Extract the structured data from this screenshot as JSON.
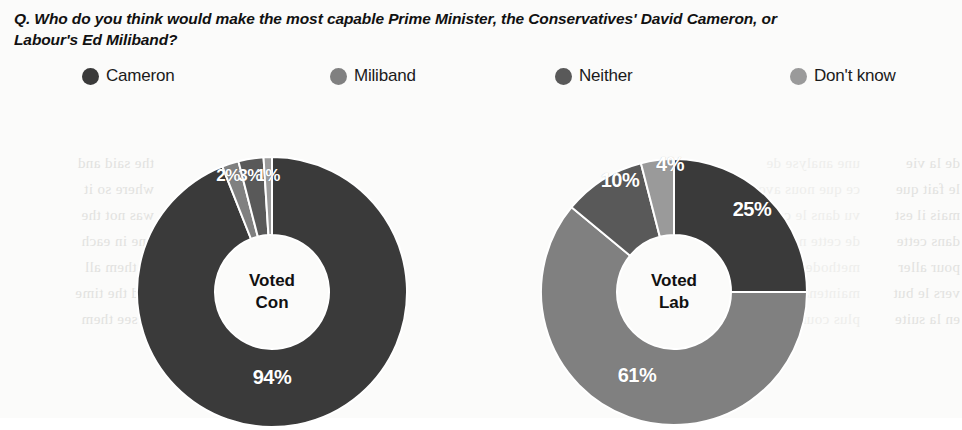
{
  "question": "Q. Who do you think would make the most capable Prime Minister, the Conservatives' David Cameron, or Labour's Ed Miliband?",
  "legend": {
    "items": [
      {
        "label": "Cameron",
        "color": "#3a3a3a",
        "x": 82,
        "icon": "legend-dot-icon"
      },
      {
        "label": "Miliband",
        "color": "#808080",
        "x": 330,
        "icon": "legend-dot-icon"
      },
      {
        "label": "Neither",
        "color": "#595959",
        "x": 555,
        "icon": "legend-dot-icon"
      },
      {
        "label": "Don't know",
        "color": "#9a9a9a",
        "x": 790,
        "icon": "legend-dot-icon"
      }
    ]
  },
  "chart_data": {
    "type": "pie",
    "title": "Q. Who do you think would make the most capable Prime Minister, the Conservatives' David Cameron, or Labour's Ed Miliband?",
    "subtitle": "",
    "xlabel": "",
    "ylabel": "",
    "legend_position": "top",
    "donut": true,
    "categories": [
      "Cameron",
      "Miliband",
      "Neither",
      "Don't know"
    ],
    "colors": [
      "#3a3a3a",
      "#808080",
      "#595959",
      "#9a9a9a"
    ],
    "charts": [
      {
        "name": "Voted Con",
        "center_label": "Voted\nCon",
        "cx": 272,
        "cy": 292,
        "outer_r": 135,
        "inner_r": 57,
        "values": [
          94,
          2,
          3,
          1
        ],
        "labels": [
          "94%",
          "2%",
          "3%",
          "1%"
        ],
        "label_positions": [
          {
            "x": 272,
            "y": 377,
            "size": "large"
          },
          {
            "x": 228,
            "y": 176,
            "size": "small"
          },
          {
            "x": 250,
            "y": 176,
            "size": "small"
          },
          {
            "x": 268,
            "y": 176,
            "size": "small"
          }
        ]
      },
      {
        "name": "Voted Lab",
        "center_label": "Voted\nLab",
        "cx": 674,
        "cy": 292,
        "outer_r": 133,
        "inner_r": 57,
        "values": [
          25,
          61,
          10,
          4
        ],
        "labels": [
          "25%",
          "61%",
          "10%",
          "4%"
        ],
        "label_positions": [
          {
            "x": 752,
            "y": 209,
            "size": "large"
          },
          {
            "x": 637,
            "y": 375,
            "size": "large"
          },
          {
            "x": 620,
            "y": 180,
            "size": "large"
          },
          {
            "x": 670,
            "y": 164,
            "size": "large"
          }
        ]
      }
    ]
  },
  "background_bleed": {
    "left": "the said and\nwhere so it\nwas not the\none in each\nof them all\nand the time\nto see them",
    "right": "de la vie\nle fait que\nmais il est\ndans cette\npour aller\nvers le but\nen la suite",
    "mid": "une analyse de\nce que nous avons\nvu dans le cadre\nde cette nouvelle\nmethode qui est\nmaintenant la\nplus courante"
  }
}
